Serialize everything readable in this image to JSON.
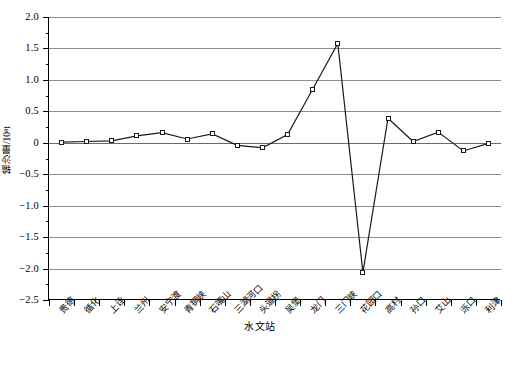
{
  "chart_data": {
    "type": "line",
    "title": "",
    "xlabel": "水文站",
    "ylabel": "输沙量/10⁸t",
    "ylim": [
      -2.5,
      2.0
    ],
    "ytick_step": 0.5,
    "grid": true,
    "legend": "none",
    "marker": "open-square",
    "line_color": "#1a1a1a",
    "grid_color": "#8d8d8d",
    "categories": [
      "贵德",
      "循化",
      "上诠",
      "兰州",
      "安宁渡",
      "青铜峡",
      "石嘴山",
      "三湖河口",
      "头道拐",
      "吴堡",
      "龙门",
      "三门峡",
      "花园口",
      "高村",
      "孙口",
      "艾山",
      "泺口",
      "利津"
    ],
    "values": [
      0.01,
      0.02,
      0.03,
      0.11,
      0.16,
      0.06,
      0.14,
      -0.04,
      -0.08,
      0.13,
      0.85,
      1.58,
      -2.06,
      0.39,
      0.02,
      0.17,
      -0.13,
      -0.01
    ],
    "ytick_labels": [
      "2.0",
      "1.5",
      "1.0",
      "0.5",
      "0",
      "−0.5",
      "−1.0",
      "−1.5",
      "−2.0",
      "−2.5"
    ],
    "ytick_values": [
      2.0,
      1.5,
      1.0,
      0.5,
      0,
      -0.5,
      -1.0,
      -1.5,
      -2.0,
      -2.5
    ]
  }
}
